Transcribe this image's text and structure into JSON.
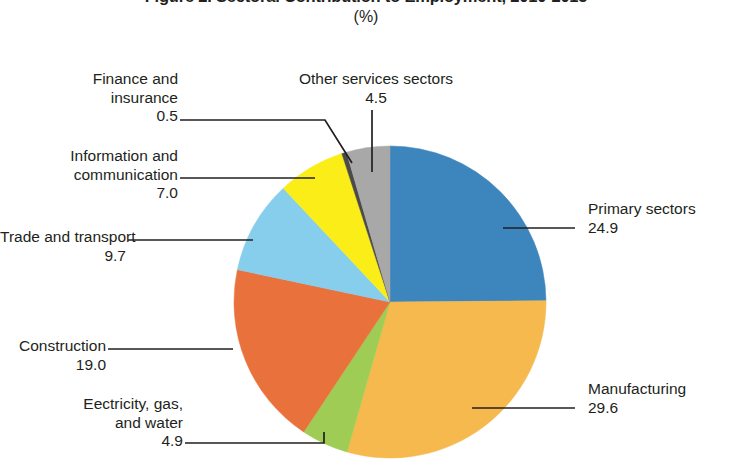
{
  "title": "Figure 2. Sectoral Contribution to Employment, 2010-2015",
  "subtitle": "(%)",
  "chart_data": {
    "type": "pie",
    "title": "Figure 2. Sectoral Contribution to Employment, 2010-2015",
    "subtitle": "(%)",
    "unit": "%",
    "legend": "none",
    "labels_position": "external-callouts",
    "start_angle_deg": 0,
    "direction": "clockwise",
    "categories": [
      "Primary sectors",
      "Manufacturing",
      "Eectricity, gas, and water",
      "Construction",
      "Trade and transport",
      "Information and communication",
      "Finance and insurance",
      "Other services sectors"
    ],
    "values": [
      24.9,
      29.6,
      4.9,
      19.0,
      9.7,
      7.0,
      0.5,
      4.5
    ],
    "colors": [
      "#3d85bd",
      "#f5b94e",
      "#9fcc54",
      "#e8713c",
      "#87cdec",
      "#fbee18",
      "#4a4a4a",
      "#a8a8a8"
    ],
    "total": 100.1
  },
  "slices": [
    {
      "name": "Primary sectors",
      "label": "Primary sectors",
      "value": "24.9",
      "color": "#3d85bd"
    },
    {
      "name": "Manufacturing",
      "label": "Manufacturing",
      "value": "29.6",
      "color": "#f5b94e"
    },
    {
      "name": "Electricity, gas, and water",
      "label_line1": "Eectricity, gas,",
      "label_line2": "and water",
      "value": "4.9",
      "color": "#9fcc54"
    },
    {
      "name": "Construction",
      "label": "Construction",
      "value": "19.0",
      "color": "#e8713c"
    },
    {
      "name": "Trade and transport",
      "label": "Trade and transport",
      "value": "9.7",
      "color": "#87cdec"
    },
    {
      "name": "Information and communication",
      "label_line1": "Information and",
      "label_line2": "communication",
      "value": "7.0",
      "color": "#fbee18"
    },
    {
      "name": "Finance and insurance",
      "label_line1": "Finance and",
      "label_line2": "insurance",
      "value": "0.5",
      "color": "#4a4a4a"
    },
    {
      "name": "Other services sectors",
      "label": "Other services sectors",
      "value": "4.5",
      "color": "#a8a8a8"
    }
  ]
}
